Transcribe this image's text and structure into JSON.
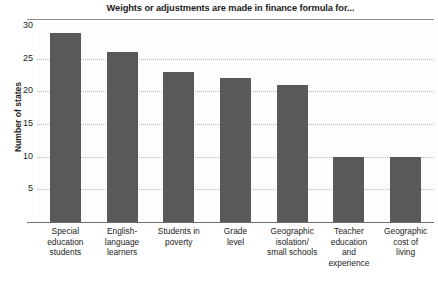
{
  "chart_data": {
    "type": "bar",
    "title": "Weights or adjustments are made in finance formula for...",
    "xlabel": "",
    "ylabel": "Number of states",
    "categories": [
      "Special education students",
      "English-language learners",
      "Students in poverty",
      "Grade level",
      "Geographic isolation/ small schools",
      "Teacher education and experience",
      "Geographic cost of living"
    ],
    "category_lines": [
      [
        "Special",
        "education",
        "students"
      ],
      [
        "English-",
        "language",
        "learners"
      ],
      [
        "Students in",
        "poverty"
      ],
      [
        "Grade",
        "level"
      ],
      [
        "Geographic",
        "isolation/",
        "small schools"
      ],
      [
        "Teacher",
        "education",
        "and",
        "experience"
      ],
      [
        "Geographic",
        "cost of",
        "living"
      ]
    ],
    "values": [
      29,
      26,
      23,
      22,
      21,
      10,
      10
    ],
    "ylim": [
      0,
      30
    ],
    "yticks": [
      5,
      10,
      15,
      20,
      25,
      30
    ],
    "ytick_labels": [
      "5",
      "10",
      "15",
      "20",
      "25",
      "30"
    ],
    "grid": "horizontal-dotted",
    "legend": "none",
    "bar_color": "#58595b",
    "plot_background": "#fdfdfd",
    "axis_color": "#6d6d6d",
    "gridline_color": "#b9b9b9"
  }
}
